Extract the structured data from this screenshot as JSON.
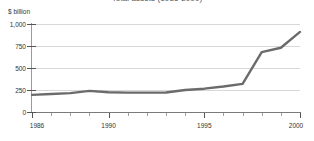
{
  "chart_data": {
    "type": "line",
    "title": "Total assets (1986-2000)",
    "xlabel": "",
    "ylabel": "$ billion",
    "x": [
      1986,
      1987,
      1988,
      1989,
      1990,
      1991,
      1992,
      1993,
      1994,
      1995,
      1996,
      1997,
      1998,
      1999,
      2000
    ],
    "values": [
      195,
      205,
      215,
      240,
      225,
      220,
      220,
      222,
      250,
      265,
      290,
      320,
      680,
      730,
      910
    ],
    "series": [
      {
        "name": "Total assets",
        "values": [
          195,
          205,
          215,
          240,
          225,
          220,
          220,
          222,
          250,
          265,
          290,
          320,
          680,
          730,
          910
        ]
      }
    ],
    "xlim": [
      1986,
      2000
    ],
    "ylim": [
      0,
      1000
    ],
    "ytick_values": [
      0,
      250,
      500,
      750,
      1000
    ],
    "ytick_labels": [
      "0",
      "250",
      "500",
      "750",
      "1,000"
    ],
    "xtick_values": [
      1986,
      1990,
      1995,
      2000
    ],
    "xtick_labels": [
      "1986",
      "1990",
      "1995",
      "2000"
    ],
    "xtick_all": [
      1986,
      1987,
      1988,
      1989,
      1990,
      1991,
      1992,
      1993,
      1994,
      1995,
      1996,
      1997,
      1998,
      1999,
      2000
    ],
    "grid": "horizontal",
    "legend": "none",
    "line_color": "#6b6b6b",
    "grid_color": "#d8d8d8",
    "axis_color": "#7a7a7a",
    "background_color": "#ffffff"
  }
}
